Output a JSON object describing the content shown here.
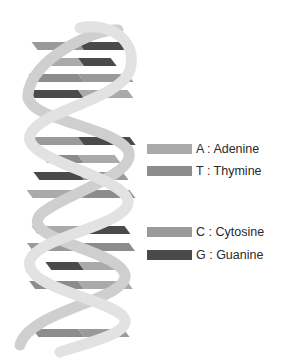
{
  "diagram": {
    "legend": [
      {
        "letter": "A",
        "label": "A : Adenine",
        "color": "#aaaaaa",
        "top": 142
      },
      {
        "letter": "T",
        "label": "T : Thymine",
        "color": "#8c8c8c",
        "top": 164
      },
      {
        "letter": "C",
        "label": "C : Cytosine",
        "color": "#9a9a9a",
        "top": 225
      },
      {
        "letter": "G",
        "label": "G : Guanine",
        "color": "#4a4a4a",
        "top": 248
      }
    ],
    "colors": {
      "strand_front": "#e2e2e2",
      "strand_back": "#cfcfcf",
      "A": "#aaaaaa",
      "T": "#8c8c8c",
      "C": "#9a9a9a",
      "G": "#4a4a4a"
    },
    "base_pairs": [
      {
        "y": 42,
        "left": "C",
        "right": "G"
      },
      {
        "y": 58,
        "left": "A",
        "right": "G"
      },
      {
        "y": 74,
        "left": "T",
        "right": "C"
      },
      {
        "y": 90,
        "left": "G",
        "right": "A"
      },
      {
        "y": 137,
        "left": "C",
        "right": "G"
      },
      {
        "y": 155,
        "left": "T",
        "right": "A"
      },
      {
        "y": 172,
        "left": "G",
        "right": "C"
      },
      {
        "y": 190,
        "left": "A",
        "right": "T"
      },
      {
        "y": 226,
        "left": "A",
        "right": "G"
      },
      {
        "y": 243,
        "left": "C",
        "right": "T"
      },
      {
        "y": 262,
        "left": "G",
        "right": "A"
      },
      {
        "y": 281,
        "left": "T",
        "right": "A"
      },
      {
        "y": 329,
        "left": "T",
        "right": "C"
      }
    ]
  }
}
